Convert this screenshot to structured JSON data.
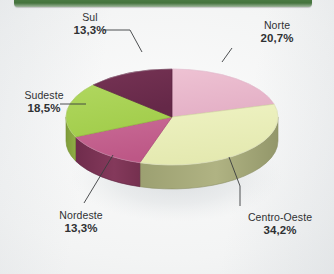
{
  "header": {
    "bar_color": "#4a7a42"
  },
  "chart_data": {
    "type": "pie",
    "title": "",
    "subtitle": "",
    "style": "3d",
    "legend_position": "callout-labels",
    "grid": false,
    "categories": [
      "Norte",
      "Centro-Oeste",
      "Nordeste",
      "Sudeste",
      "Sul"
    ],
    "values": [
      20.7,
      34.2,
      13.3,
      18.5,
      13.3
    ],
    "value_labels": [
      "20,7%",
      "34,2%",
      "13,3%",
      "18,5%",
      "13,3%"
    ],
    "unit": "%",
    "decimal_separator": ",",
    "colors": [
      "#e9b9cd",
      "#e9eeb9",
      "#c4608f",
      "#a9d254",
      "#6d2d4f"
    ],
    "side_colors": [
      "#d49cb4",
      "#a9ab77",
      "#7d3355",
      "#8aa840",
      "#55203c"
    ],
    "slices": [
      {
        "label": "Norte",
        "value": 20.7,
        "value_label": "20,7%",
        "color": "#e9b9cd"
      },
      {
        "label": "Centro-Oeste",
        "value": 34.2,
        "value_label": "34,2%",
        "color": "#e9eeb9"
      },
      {
        "label": "Nordeste",
        "value": 13.3,
        "value_label": "13,3%",
        "color": "#c4608f"
      },
      {
        "label": "Sudeste",
        "value": 18.5,
        "value_label": "18,5%",
        "color": "#a9d254"
      },
      {
        "label": "Sul",
        "value": 13.3,
        "value_label": "13,3%",
        "color": "#6d2d4f"
      }
    ]
  },
  "labels": {
    "sul": {
      "name": "Sul",
      "pct": "13,3%"
    },
    "norte": {
      "name": "Norte",
      "pct": "20,7%"
    },
    "sudeste": {
      "name": "Sudeste",
      "pct": "18,5%"
    },
    "nordeste": {
      "name": "Nordeste",
      "pct": "13,3%"
    },
    "centro_oeste": {
      "name": "Centro-Oeste",
      "pct": "34,2%"
    }
  }
}
